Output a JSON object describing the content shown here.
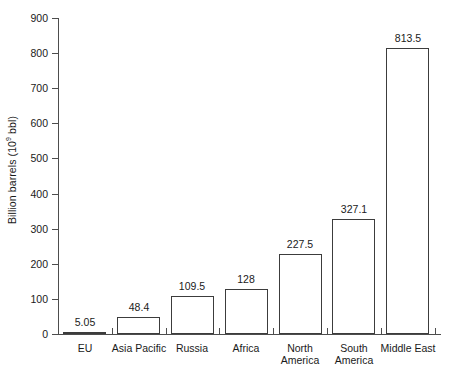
{
  "chart_data": {
    "type": "bar",
    "title": "",
    "subtitle": "",
    "xlabel": "",
    "ylabel": "Billion barrels (10⁹ bbl)",
    "ylabel_parts": {
      "pre": "Billion barrels (10",
      "sup": "9",
      "post": " bbl)"
    },
    "categories": [
      "EU",
      "Asia Pacific",
      "Russia",
      "Africa",
      "North America",
      "South America",
      "Middle East"
    ],
    "category_lines": [
      [
        "EU"
      ],
      [
        "Asia Pacific"
      ],
      [
        "Russia"
      ],
      [
        "Africa"
      ],
      [
        "North",
        "America"
      ],
      [
        "South",
        "America"
      ],
      [
        "Middle East"
      ]
    ],
    "values": [
      5.05,
      48.4,
      109.5,
      128,
      227.5,
      327.1,
      813.5
    ],
    "value_labels": [
      "5.05",
      "48.4",
      "109.5",
      "128",
      "227.5",
      "327.1",
      "813.5"
    ],
    "ylim": [
      0,
      900
    ],
    "ytick_values": [
      0,
      100,
      200,
      300,
      400,
      500,
      600,
      700,
      800,
      900
    ],
    "ytick_labels": [
      "0",
      "100",
      "200",
      "300",
      "400",
      "500",
      "600",
      "700",
      "800",
      "900"
    ],
    "grid": false,
    "legend": null,
    "legend_position": "none",
    "bar_fill_color": "#ffffff",
    "bar_edge_color": "#3c3c3c",
    "axis_color": "#4d4d4d",
    "text_color": "#1a1a1a",
    "background_color": "#ffffff"
  }
}
